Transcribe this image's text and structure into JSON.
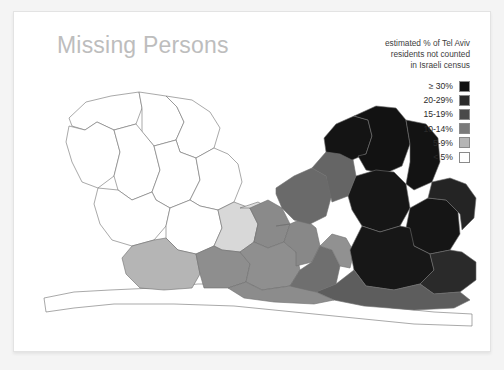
{
  "card": {
    "title": "Missing Persons"
  },
  "legend": {
    "caption_lines": [
      "estimated % of Tel Aviv",
      "residents not counted",
      "in Israeli census"
    ],
    "items": [
      {
        "label": "≥ 30%",
        "color": "#111111"
      },
      {
        "label": "20-29%",
        "color": "#2b2b2b"
      },
      {
        "label": "15-19%",
        "color": "#4a4a4a"
      },
      {
        "label": "10-14%",
        "color": "#7a7a7a"
      },
      {
        "label": "5-9%",
        "color": "#b5b5b5"
      },
      {
        "label": "< 5%",
        "color": "#ffffff"
      }
    ]
  },
  "map": {
    "stroke_color": "#6e6e6e",
    "regions": [
      {
        "name": "north-west-a",
        "bin": "< 5%",
        "color": "#ffffff",
        "points": "55,106 72,90 97,84 125,80 128,96 122,112 100,118 83,110 71,118 58,114"
      },
      {
        "name": "north-west-b",
        "bin": "< 5%",
        "color": "#ffffff",
        "points": "125,80 152,84 163,95 170,110 162,128 140,134 128,120 128,96"
      },
      {
        "name": "north-central",
        "bin": "< 5%",
        "color": "#ffffff",
        "points": "152,84 178,88 196,100 206,116 200,136 182,146 166,140 162,128 170,110 163,95"
      },
      {
        "name": "west-mid-a",
        "bin": "< 5%",
        "color": "#ffffff",
        "points": "55,114 71,118 83,110 100,118 106,140 100,164 84,176 68,170 58,150 52,130"
      },
      {
        "name": "west-mid-b",
        "bin": "< 5%",
        "color": "#ffffff",
        "points": "100,118 122,112 140,134 146,158 138,180 118,188 104,178 100,164 106,140"
      },
      {
        "name": "west-mid-c",
        "bin": "< 5%",
        "color": "#ffffff",
        "points": "140,134 162,128 166,140 182,146 186,168 176,188 156,196 142,188 138,180 146,158"
      },
      {
        "name": "central-white-a",
        "bin": "< 5%",
        "color": "#ffffff",
        "points": "182,146 200,136 214,142 224,152 228,170 220,190 204,198 186,194 176,188 186,168"
      },
      {
        "name": "central-white-b",
        "bin": "< 5%",
        "color": "#ffffff",
        "points": "84,176 104,178 118,188 138,180 142,188 156,196 152,214 140,228 118,234 98,228 86,212 80,192"
      },
      {
        "name": "central-white-c",
        "bin": "< 5%",
        "color": "#ffffff",
        "points": "156,196 176,188 186,194 204,198 208,216 200,234 182,242 164,238 152,226 152,214"
      },
      {
        "name": "enclave-lightest",
        "bin": "5-9%",
        "color": "#d8d8d8",
        "points": "204,198 220,190 236,196 244,212 240,230 226,240 208,238 200,234 208,216"
      },
      {
        "name": "enclave-light-b",
        "bin": "5-9%",
        "color": "#dddddd",
        "points": "226,196 244,190 258,198 262,214 254,228 240,230 244,212 236,196"
      },
      {
        "name": "south-west-strip",
        "bin": "< 5%",
        "color": "#ffffff",
        "points": "30,286 60,280 96,278 140,276 184,272 226,272 264,276 300,282 340,290 380,296 420,300 458,302 458,314 400,312 340,306 280,300 220,294 160,292 100,292 60,296 32,300"
      },
      {
        "name": "south-central-a",
        "bin": "5-9%",
        "color": "#b5b5b5",
        "points": "118,234 140,228 152,226 164,238 182,242 186,262 178,276 150,278 126,276 112,262 108,246"
      },
      {
        "name": "south-central-b",
        "bin": "10-14%",
        "color": "#8e8e8e",
        "points": "182,242 200,234 208,238 226,240 236,252 232,270 214,276 190,276 186,262"
      },
      {
        "name": "mid-gray-a",
        "bin": "10-14%",
        "color": "#8a8a8a",
        "points": "236,196 254,188 268,196 276,212 270,230 254,236 240,230 244,212"
      },
      {
        "name": "mid-gray-b",
        "bin": "10-14%",
        "color": "#8f8f8f",
        "points": "226,240 240,230 254,236 270,230 282,240 286,258 276,274 248,278 232,270 236,252"
      },
      {
        "name": "mid-gray-c",
        "bin": "10-14%",
        "color": "#888888",
        "points": "262,214 276,212 290,206 302,216 306,234 298,250 282,254 282,240 270,230 276,212"
      },
      {
        "name": "mid-gray-d",
        "bin": "15-19%",
        "color": "#6f6f6f",
        "points": "286,258 298,250 306,234 318,238 326,254 322,272 302,280 282,278 276,274"
      },
      {
        "name": "mid-gray-e",
        "bin": "10-14%",
        "color": "#919191",
        "points": "306,234 318,222 332,226 340,240 336,256 326,254 318,238"
      },
      {
        "name": "upper-mid-gray",
        "bin": "15-19%",
        "color": "#6a6a6a",
        "points": "262,176 280,164 298,156 312,164 318,182 312,204 296,212 280,208 268,196 262,182"
      },
      {
        "name": "upper-mid-gray-b",
        "bin": "15-19%",
        "color": "#656565",
        "points": "298,156 312,140 326,132 338,142 342,164 334,184 318,190 312,164"
      },
      {
        "name": "dark-ne-peak",
        "bin": "≥ 30%",
        "color": "#141414",
        "points": "310,126 322,112 340,104 354,108 358,124 352,142 338,148 326,142 312,140"
      },
      {
        "name": "dark-ne-main",
        "bin": "≥ 30%",
        "color": "#121212",
        "points": "340,104 362,94 382,96 392,108 396,132 388,154 370,162 352,158 344,144 352,142 358,124 354,108"
      },
      {
        "name": "dark-ne-lobe",
        "bin": "≥ 30%",
        "color": "#161616",
        "points": "342,164 362,158 380,160 392,172 396,196 386,214 366,220 348,214 338,198 334,184"
      },
      {
        "name": "dark-east-a",
        "bin": "≥ 30%",
        "color": "#131313",
        "points": "392,108 412,112 424,126 426,150 418,170 400,178 392,172 396,150 396,132"
      },
      {
        "name": "dark-east-b",
        "bin": "≥ 30%",
        "color": "#151515",
        "points": "396,196 414,186 432,188 444,200 446,222 436,238 416,242 400,234 392,216"
      },
      {
        "name": "dark-east-c",
        "bin": "20-29%",
        "color": "#242424",
        "points": "418,170 436,166 452,172 462,186 460,206 448,218 446,202 432,188 414,186"
      },
      {
        "name": "dark-south-a",
        "bin": "≥ 30%",
        "color": "#171717",
        "points": "348,214 366,220 386,214 396,216 400,234 416,242 420,258 406,272 380,278 352,274 340,258 336,238"
      },
      {
        "name": "dark-south-b",
        "bin": "20-29%",
        "color": "#2a2a2a",
        "points": "416,242 436,238 448,240 462,250 462,268 446,280 420,282 406,272 420,258"
      },
      {
        "name": "south-dark-edge",
        "bin": "15-19%",
        "color": "#5d5d5d",
        "points": "322,272 340,258 352,274 380,278 406,272 420,282 446,280 456,288 440,296 400,298 350,294 320,288 302,280"
      },
      {
        "name": "south-mid-edge",
        "bin": "10-14%",
        "color": "#8c8c8c",
        "points": "248,278 276,274 302,280 320,288 300,292 260,290 230,286 214,276 232,270"
      }
    ]
  }
}
